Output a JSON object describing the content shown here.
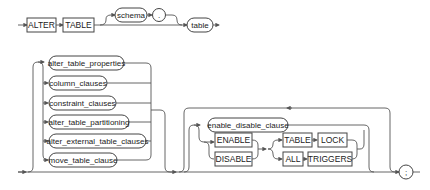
{
  "diagram": {
    "type": "railroad-syntax-diagram",
    "statement": "ALTER TABLE",
    "row1": {
      "keywords": [
        "ALTER",
        "TABLE"
      ],
      "optional_prefix": {
        "schema": "schema",
        "separator": "."
      },
      "table": "table"
    },
    "choice_clauses": [
      "alter_table_properties",
      "column_clauses",
      "constraint_clauses",
      "alter_table_partitioning",
      "alter_external_table_clauses",
      "move_table_clause"
    ],
    "repeat_group": {
      "clause": "enable_disable_clause",
      "toggle": [
        "ENABLE",
        "DISABLE"
      ],
      "targets": [
        {
          "first": "TABLE",
          "second": "LOCK"
        },
        {
          "first": "ALL",
          "second": "TRIGGERS"
        }
      ]
    },
    "terminator": ";"
  }
}
